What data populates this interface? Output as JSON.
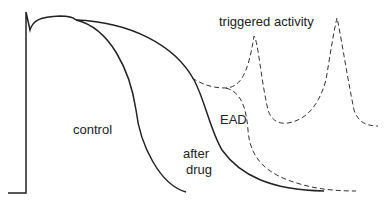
{
  "diagram": {
    "type": "cardiac action potential traces",
    "labels": {
      "triggered": "triggered activity",
      "control": "control",
      "ead": "EAD",
      "after_drug_1": "after",
      "after_drug_2": "drug"
    },
    "traces": [
      {
        "name": "control",
        "style": "solid"
      },
      {
        "name": "after drug",
        "style": "solid"
      },
      {
        "name": "EAD / triggered activity",
        "style": "dashed"
      }
    ],
    "colors": {
      "line": "#222222",
      "background": "#ffffff"
    }
  }
}
